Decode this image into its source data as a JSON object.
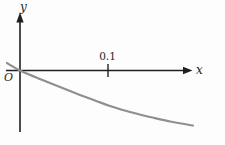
{
  "figure": {
    "background": "#fdfdfd",
    "axis_color": "#1f1f1f",
    "curve_color": "#8f8f8f",
    "labels": {
      "y_axis": "y",
      "x_axis": "x",
      "origin": "O"
    }
  },
  "chart_data": {
    "type": "line",
    "title": "",
    "xlabel": "x",
    "ylabel": "y",
    "origin_label": "O",
    "grid": false,
    "legend": null,
    "xlim": [
      -0.016,
      0.196
    ],
    "ylim": [
      -0.07,
      0.065
    ],
    "x_ticks": [
      {
        "value": 0.1,
        "label": "0.1"
      }
    ],
    "y_ticks": [],
    "series": [
      {
        "name": "curve",
        "color": "#8f8f8f",
        "points": [
          [
            -0.0148,
            0.0085
          ],
          [
            0.0,
            0.0
          ],
          [
            0.017,
            -0.0074
          ],
          [
            0.0341,
            -0.0142
          ],
          [
            0.0511,
            -0.021
          ],
          [
            0.0682,
            -0.0278
          ],
          [
            0.0852,
            -0.0341
          ],
          [
            0.1023,
            -0.0403
          ],
          [
            0.125,
            -0.0472
          ],
          [
            0.1477,
            -0.0528
          ],
          [
            0.1705,
            -0.058
          ],
          [
            0.1966,
            -0.0625
          ]
        ]
      }
    ]
  }
}
